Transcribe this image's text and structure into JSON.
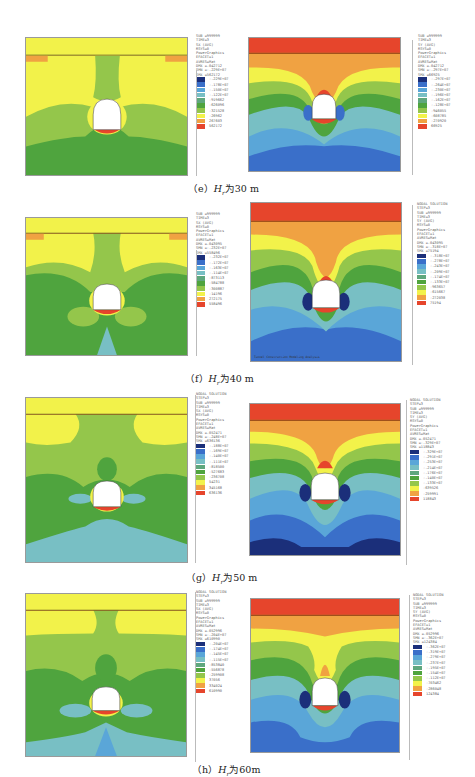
{
  "figures": [
    {
      "id": "e",
      "caption": {
        "prefix": "（e）",
        "var": "H",
        "sub": "r",
        "text": "为30 m"
      },
      "left": {
        "header": [
          "SUB =999999",
          "TIME=3",
          "SX       (AVG)",
          "RSYS=0",
          "PowerGraphics",
          "EFACET=1",
          "AVRES=Mat",
          "DMX =.042712",
          "SMN =-.229E+07",
          "SMX =562172"
        ],
        "levels": [
          "-.229E+07",
          "-.178E+07",
          "-.150E+07",
          "-.122E+07",
          "-919662",
          "-626096",
          "-321528",
          "-26962",
          "267603",
          "562172"
        ]
      },
      "right": {
        "header": [
          "SUB =999999",
          "TIME=3",
          "SY       (AVG)",
          "RSYS=0",
          "PowerGraphics",
          "EFACET=1",
          "AVRES=Mat",
          "DMX =.042712",
          "SMN =-.297E+07",
          "SMX =66925"
        ],
        "levels": [
          "-.297E+07",
          "-.264E+07",
          "-.230E+07",
          "-.196E+07",
          "-.162E+07",
          "-.128E+07",
          "-946055",
          "-608785",
          "-270920",
          "66925"
        ]
      }
    },
    {
      "id": "f",
      "caption": {
        "prefix": "（f）",
        "var": "H",
        "sub": "r",
        "text": "为40 m"
      },
      "left": {
        "header": [
          "SUB =999999",
          "TIME=3",
          "SX       (AVG)",
          "RSYS=0",
          "PowerGraphics",
          "EFACET=1",
          "AVRES=Mat",
          "DMX =.043095",
          "SMN =-.232E+07",
          "SMX =558496"
        ],
        "levels": [
          "-.232E+07",
          "-.172E+07",
          "-.163E+07",
          "-.114E+07",
          "-873113",
          "-584788",
          "-300887",
          "-14196",
          "272175",
          "558496"
        ]
      },
      "right": {
        "header": [
          "NODAL SOLUTION",
          "STEP=3",
          "SUB =999999",
          "TIME=3",
          "SY       (AVG)",
          "RSYS=0",
          "PowerGraphics",
          "EFACET=1",
          "AVRES=Mat",
          "DMX =.043095",
          "SMN =-.318E+07",
          "SMX =75194"
        ],
        "levels": [
          "-.318E+07",
          "-.278E+07",
          "-.243E+07",
          "-.209E+07",
          "-.174E+07",
          "-.133E+07",
          "-963657",
          "-615667",
          "-272038",
          "75194"
        ],
        "watermark": "Tunnel Construction Modeling Analysis"
      }
    },
    {
      "id": "g",
      "caption": {
        "prefix": "（g）",
        "var": "H",
        "sub": "r",
        "text": "为50 m"
      },
      "left": {
        "header": [
          "NODAL SOLUTION",
          "STEP=3",
          "SUB =999999",
          "TIME=3",
          "SX       (AVG)",
          "RSYS=0",
          "PowerGraphics",
          "EFACET=1",
          "AVRES=Mat",
          "DMX =.052471",
          "SMN =-.248E+07",
          "SMX =636136"
        ],
        "levels": [
          "-.188E+07",
          "-.169E+07",
          "-.140E+07",
          "-.111E+07",
          "-818500",
          "-527683",
          "-236708",
          "54231",
          "345168",
          "636136"
        ]
      },
      "right": {
        "header": [
          "NODAL SOLUTION",
          "STEP=3",
          "SUB =999999",
          "TIME=3",
          "SY       (AVG)",
          "RSYS=0",
          "PowerGraphics",
          "EFACET=1",
          "AVRES=Mat",
          "DMX =.052471",
          "SMN =-.329E+07",
          "SMX =118843"
        ],
        "levels": [
          "-.329E+07",
          "-.291E+07",
          "-.253E+07",
          "-.214E+07",
          "-.176E+07",
          "-.140E+07",
          "-.133E+07",
          "-639526",
          "-259991",
          "118843"
        ]
      }
    },
    {
      "id": "h",
      "caption": {
        "prefix": "（h）",
        "var": "H",
        "sub": "r",
        "text": "为60m"
      },
      "left": {
        "header": [
          "NODAL SOLUTION",
          "STEP=3",
          "SUB =999999",
          "TIME=3",
          "SX       (AVG)",
          "RSYS=0",
          "PowerGraphics",
          "EFACET=1",
          "AVRES=Mat",
          "DMX =.052996",
          "SMN =-.204E+07",
          "SMX =610990"
        ],
        "levels": [
          "-.204E+07",
          "-.174E+07",
          "-.145E+07",
          "-.115E+07",
          "-853840",
          "-556878",
          "-259908",
          "37056",
          "334024",
          "610990"
        ]
      },
      "right": {
        "header": [
          "NODAL SOLUTION",
          "STEP=3",
          "SUB =999999",
          "TIME=3",
          "SY       (AVG)",
          "RSYS=0",
          "PowerGraphics",
          "EFACET=1",
          "AVRES=Mat",
          "DMX =.052996",
          "SMN =-.362E+07",
          "SMX =124384"
        ],
        "levels": [
          "-.362E+07",
          "-.319E+07",
          "-.279E+07",
          "-.237E+07",
          "-.195E+07",
          "-.154E+07",
          "-.112E+07",
          "-703462",
          "-286048",
          "124384"
        ]
      }
    }
  ],
  "palette": [
    "#1b2f7a",
    "#3a6fc9",
    "#5aa6d8",
    "#78bfc4",
    "#5fa77d",
    "#4fa43e",
    "#94c64b",
    "#f2f24a",
    "#f0a242",
    "#e6452c"
  ]
}
